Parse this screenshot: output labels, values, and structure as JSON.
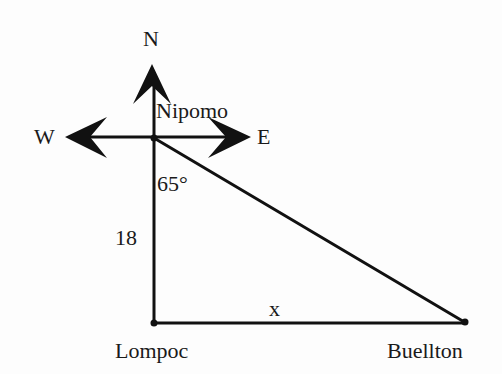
{
  "diagram": {
    "type": "right-triangle-navigation",
    "compass": {
      "north_label": "N",
      "west_label": "W",
      "east_label": "E"
    },
    "points": {
      "top": {
        "label": "Nipomo"
      },
      "bottom_left": {
        "label": "Lompoc"
      },
      "bottom_right": {
        "label": "Buellton"
      }
    },
    "angle_label": "65°",
    "side_labels": {
      "vertical": "18",
      "horizontal": "x"
    },
    "colors": {
      "stroke": "#111111",
      "background": "#fdfdfd",
      "text": "#1a1a1a"
    }
  }
}
